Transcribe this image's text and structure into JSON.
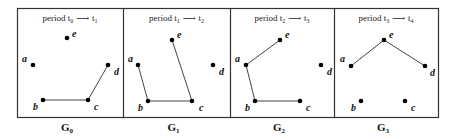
{
  "figure": {
    "frame": {
      "x": 17,
      "y": 8,
      "width": 421,
      "height": 109
    },
    "stroke_color": "#333333",
    "dot_color": "#000000",
    "panels": [
      {
        "id": "G0",
        "label": "G",
        "label_sub": "0",
        "x0": 17,
        "x1": 123,
        "title": {
          "prefix": "period t",
          "from_sub": "0",
          "arrow": "⟶",
          "to": "t",
          "to_sub": "1"
        },
        "nodes": [
          {
            "name": "a",
            "x": 33,
            "y": 65,
            "lx": 22,
            "ly": 62
          },
          {
            "name": "b",
            "x": 43,
            "y": 100,
            "lx": 33,
            "ly": 110
          },
          {
            "name": "c",
            "x": 88,
            "y": 100,
            "lx": 94,
            "ly": 110
          },
          {
            "name": "d",
            "x": 108,
            "y": 65,
            "lx": 114,
            "ly": 75
          },
          {
            "name": "e",
            "x": 67,
            "y": 38,
            "lx": 72,
            "ly": 37
          }
        ],
        "edges": [
          [
            "b",
            "c"
          ],
          [
            "c",
            "d"
          ]
        ]
      },
      {
        "id": "G1",
        "label": "G",
        "label_sub": "1",
        "x0": 123,
        "x1": 230,
        "title": {
          "prefix": "period t",
          "from_sub": "1",
          "arrow": "⟶",
          "to": "t",
          "to_sub": "2"
        },
        "nodes": [
          {
            "name": "a",
            "x": 138,
            "y": 65,
            "lx": 128,
            "ly": 62
          },
          {
            "name": "b",
            "x": 148,
            "y": 101,
            "lx": 138,
            "ly": 111
          },
          {
            "name": "c",
            "x": 192,
            "y": 101,
            "lx": 199,
            "ly": 111
          },
          {
            "name": "d",
            "x": 213,
            "y": 65,
            "lx": 219,
            "ly": 75
          },
          {
            "name": "e",
            "x": 172,
            "y": 40,
            "lx": 177,
            "ly": 38
          }
        ],
        "edges": [
          [
            "a",
            "b"
          ],
          [
            "b",
            "c"
          ],
          [
            "c",
            "e"
          ]
        ]
      },
      {
        "id": "G2",
        "label": "G",
        "label_sub": "2",
        "x0": 230,
        "x1": 334,
        "title": {
          "prefix": "period t",
          "from_sub": "2",
          "arrow": "⟶",
          "to": "t",
          "to_sub": "3"
        },
        "nodes": [
          {
            "name": "a",
            "x": 246,
            "y": 65,
            "lx": 235,
            "ly": 62
          },
          {
            "name": "b",
            "x": 255,
            "y": 101,
            "lx": 245,
            "ly": 111
          },
          {
            "name": "c",
            "x": 300,
            "y": 101,
            "lx": 306,
            "ly": 111
          },
          {
            "name": "d",
            "x": 321,
            "y": 65,
            "lx": 327,
            "ly": 75
          },
          {
            "name": "e",
            "x": 280,
            "y": 40,
            "lx": 285,
            "ly": 38
          }
        ],
        "edges": [
          [
            "e",
            "a"
          ],
          [
            "a",
            "b"
          ],
          [
            "b",
            "c"
          ]
        ]
      },
      {
        "id": "G3",
        "label": "G",
        "label_sub": "3",
        "x0": 334,
        "x1": 438,
        "title": {
          "prefix": "period t",
          "from_sub": "3",
          "arrow": "⟶",
          "to": "t",
          "to_sub": "4"
        },
        "nodes": [
          {
            "name": "a",
            "x": 351,
            "y": 66,
            "lx": 340,
            "ly": 62
          },
          {
            "name": "b",
            "x": 361,
            "y": 101,
            "lx": 351,
            "ly": 111
          },
          {
            "name": "c",
            "x": 405,
            "y": 101,
            "lx": 411,
            "ly": 111
          },
          {
            "name": "d",
            "x": 425,
            "y": 66,
            "lx": 430,
            "ly": 76
          },
          {
            "name": "e",
            "x": 384,
            "y": 40,
            "lx": 389,
            "ly": 38
          }
        ],
        "edges": [
          [
            "a",
            "e"
          ],
          [
            "e",
            "d"
          ]
        ]
      }
    ]
  }
}
